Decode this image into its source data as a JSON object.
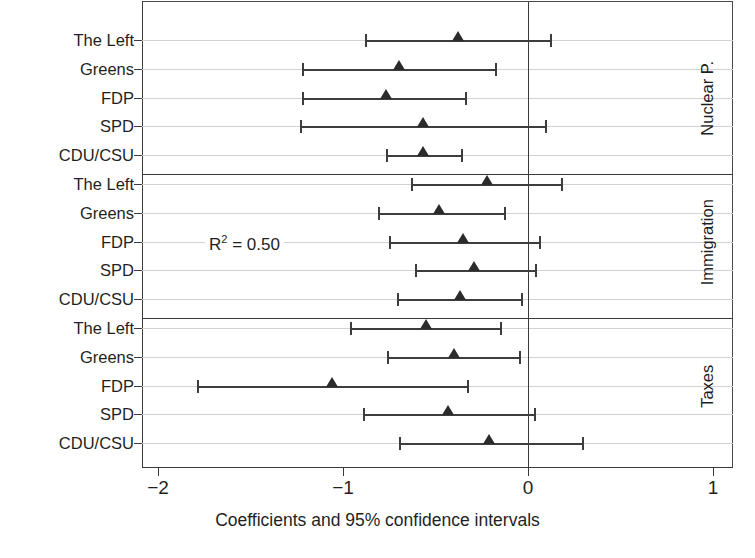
{
  "chart_data": {
    "type": "scatter",
    "title": "",
    "xlabel": "Coefficients and 95% confidence intervals",
    "ylabel": "",
    "xlim": [
      -2,
      1
    ],
    "xticks": [
      -2,
      -1,
      0,
      1
    ],
    "xticklabels": [
      "−2",
      "−1",
      "0",
      "1"
    ],
    "grid": true,
    "zero_reference_line": 0,
    "legend": "none",
    "annotations": [
      {
        "text": "R2 = 0.50",
        "display": "R",
        "sup": "2",
        "rest": " = 0.50",
        "panel": "Immigration",
        "row": "FDP"
      }
    ],
    "panels": [
      {
        "name": "Nuclear P.",
        "rows": [
          {
            "label": "The Left",
            "estimate": -0.38,
            "ci_low": -0.88,
            "ci_high": 0.12
          },
          {
            "label": "Greens",
            "estimate": -0.7,
            "ci_low": -1.22,
            "ci_high": -0.18
          },
          {
            "label": "FDP",
            "estimate": -0.77,
            "ci_low": -1.22,
            "ci_high": -0.34
          },
          {
            "label": "SPD",
            "estimate": -0.57,
            "ci_low": -1.23,
            "ci_high": 0.09
          },
          {
            "label": "CDU/CSU",
            "estimate": -0.57,
            "ci_low": -0.77,
            "ci_high": -0.36
          }
        ]
      },
      {
        "name": "Immigration",
        "rows": [
          {
            "label": "The Left",
            "estimate": -0.22,
            "ci_low": -0.63,
            "ci_high": 0.18
          },
          {
            "label": "Greens",
            "estimate": -0.48,
            "ci_low": -0.81,
            "ci_high": -0.13
          },
          {
            "label": "FDP",
            "estimate": -0.35,
            "ci_low": -0.75,
            "ci_high": 0.06
          },
          {
            "label": "SPD",
            "estimate": -0.29,
            "ci_low": -0.61,
            "ci_high": 0.04
          },
          {
            "label": "CDU/CSU",
            "estimate": -0.37,
            "ci_low": -0.71,
            "ci_high": -0.04
          }
        ]
      },
      {
        "name": "Taxes",
        "rows": [
          {
            "label": "The Left",
            "estimate": -0.55,
            "ci_low": -0.96,
            "ci_high": -0.15
          },
          {
            "label": "Greens",
            "estimate": -0.4,
            "ci_low": -0.76,
            "ci_high": -0.05
          },
          {
            "label": "FDP",
            "estimate": -1.06,
            "ci_low": -1.79,
            "ci_high": -0.33
          },
          {
            "label": "SPD",
            "estimate": -0.43,
            "ci_low": -0.89,
            "ci_high": 0.03
          },
          {
            "label": "CDU/CSU",
            "estimate": -0.21,
            "ci_low": -0.7,
            "ci_high": 0.29
          }
        ]
      }
    ],
    "colors": {
      "marker": "#2b2b2b",
      "ci": "#3d3d3d",
      "axis": "#3a3a3a",
      "grid": "#d2d2d2",
      "background": "#ffffff"
    }
  }
}
